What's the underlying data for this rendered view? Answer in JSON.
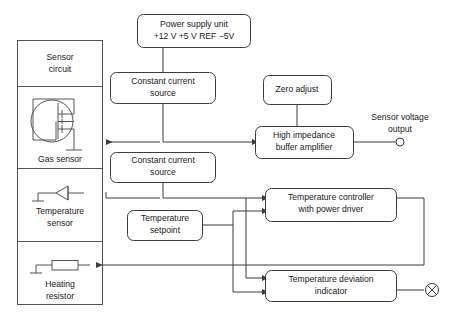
{
  "diagram": {
    "background_color": "#ffffff",
    "line_color": "#3c3c3c",
    "text_color": "#1a1a1a"
  },
  "sensor_column": {
    "name": "sensor-circuit-column",
    "cells": [
      {
        "label_line1": "Sensor",
        "label_line2": "circuit",
        "symbol": "none"
      },
      {
        "label_line1": "Gas sensor",
        "label_line2": "",
        "symbol": "mosfet-in-circle"
      },
      {
        "label_line1": "Temperature",
        "label_line2": "sensor",
        "symbol": "diode"
      },
      {
        "label_line1": "Heating",
        "label_line2": "resistor",
        "symbol": "resistor"
      }
    ]
  },
  "blocks": {
    "power_supply": {
      "line1": "Power supply unit",
      "line2": "+12 V +5 V REF −5V"
    },
    "constant_current_top": {
      "line1": "Constant current",
      "line2": "source"
    },
    "constant_current_bottom": {
      "line1": "Constant current",
      "line2": "source"
    },
    "zero_adjust": {
      "line1": "Zero adjust",
      "line2": ""
    },
    "buffer_amplifier": {
      "line1": "High impedance",
      "line2": "buffer amplifier"
    },
    "temperature_setpoint": {
      "line1": "Temperature",
      "line2": "setpoint"
    },
    "temperature_controller": {
      "line1": "Temperature controller",
      "line2": "with power driver"
    },
    "deviation_indicator": {
      "line1": "Temperature deviation",
      "line2": "indicator"
    }
  },
  "outputs": {
    "sensor_voltage": {
      "line1": "Sensor voltage",
      "line2": "output",
      "terminal": "open-circle-terminal"
    },
    "indicator_lamp": {
      "terminal": "crossed-circle-lamp"
    }
  }
}
